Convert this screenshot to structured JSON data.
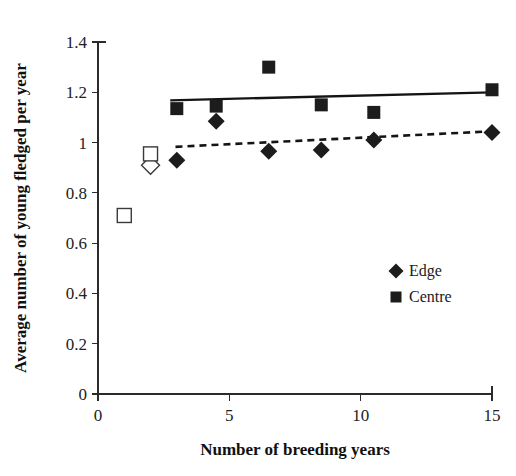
{
  "chart_data": {
    "type": "scatter",
    "title": "",
    "xlabel": "Number of breeding years",
    "ylabel": "Average number of young fledged per year",
    "xlim": [
      0,
      15
    ],
    "ylim": [
      0,
      1.4
    ],
    "grid": false,
    "x_ticks": [
      "0",
      "5",
      "10",
      "15"
    ],
    "x_tick_values": [
      0,
      5,
      10,
      15
    ],
    "y_ticks": [
      "0",
      "0.2",
      "0.4",
      "0.6",
      "0.8",
      "1",
      "1.2",
      "1.4"
    ],
    "y_tick_values": [
      0,
      0.2,
      0.4,
      0.6,
      0.8,
      1,
      1.2,
      1.4
    ],
    "legend_position": "inside-lower-right",
    "series": [
      {
        "name": "Edge",
        "marker": "diamond",
        "fill": "solid",
        "color": "#1c1c1c",
        "x": [
          3,
          4.5,
          6.5,
          8.5,
          10.5,
          15
        ],
        "y": [
          0.93,
          1.085,
          0.965,
          0.97,
          1.01,
          1.04
        ]
      },
      {
        "name": "Centre",
        "marker": "square",
        "fill": "solid",
        "color": "#1c1c1c",
        "x": [
          3,
          4.5,
          6.5,
          8.5,
          10.5,
          15
        ],
        "y": [
          1.135,
          1.145,
          1.3,
          1.15,
          1.12,
          1.21
        ]
      },
      {
        "name": "Edge open",
        "marker": "diamond",
        "fill": "open",
        "color": "#3a3a3a",
        "x": [
          2
        ],
        "y": [
          0.91
        ]
      },
      {
        "name": "Centre open",
        "marker": "square",
        "fill": "open",
        "color": "#3a3a3a",
        "x": [
          1,
          2
        ],
        "y": [
          0.71,
          0.955
        ]
      }
    ],
    "trendlines": [
      {
        "name": "Centre trend",
        "style": "solid",
        "x": [
          2.75,
          15
        ],
        "y": [
          1.168,
          1.2
        ]
      },
      {
        "name": "Edge trend",
        "style": "dashed",
        "x": [
          2.95,
          15
        ],
        "y": [
          0.983,
          1.045
        ]
      }
    ]
  },
  "legend": {
    "items": [
      {
        "label": "Edge",
        "marker": "diamond"
      },
      {
        "label": "Centre",
        "marker": "square"
      }
    ]
  }
}
